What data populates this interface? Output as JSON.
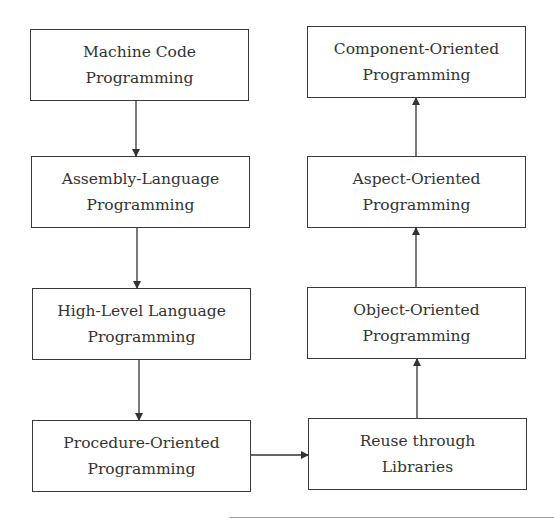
{
  "diagram": {
    "type": "flowchart",
    "nodes": [
      {
        "id": "machine_code",
        "line1": "Machine Code",
        "line2": "Programming"
      },
      {
        "id": "assembly",
        "line1": "Assembly-Language",
        "line2": "Programming"
      },
      {
        "id": "high_level",
        "line1": "High-Level Language",
        "line2": "Programming"
      },
      {
        "id": "procedure",
        "line1": "Procedure-Oriented",
        "line2": "Programming"
      },
      {
        "id": "reuse",
        "line1": "Reuse through",
        "line2": "Libraries"
      },
      {
        "id": "object",
        "line1": "Object-Oriented",
        "line2": "Programming"
      },
      {
        "id": "aspect",
        "line1": "Aspect-Oriented",
        "line2": "Programming"
      },
      {
        "id": "component",
        "line1": "Component-Oriented",
        "line2": "Programming"
      }
    ],
    "edges": [
      {
        "from": "machine_code",
        "to": "assembly"
      },
      {
        "from": "assembly",
        "to": "high_level"
      },
      {
        "from": "high_level",
        "to": "procedure"
      },
      {
        "from": "procedure",
        "to": "reuse"
      },
      {
        "from": "reuse",
        "to": "object"
      },
      {
        "from": "object",
        "to": "aspect"
      },
      {
        "from": "aspect",
        "to": "component"
      }
    ],
    "colors": {
      "stroke": "#3a3a3a",
      "text": "#333333",
      "background": "#ffffff"
    }
  }
}
